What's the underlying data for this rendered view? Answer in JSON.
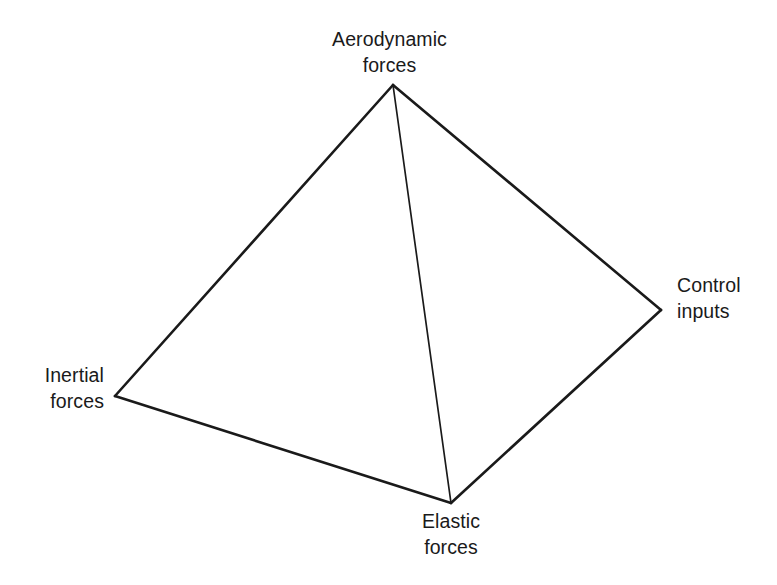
{
  "figure": {
    "type": "tetrahedron-diagram",
    "background_color": "#ffffff",
    "stroke_color": "#1a1a1a",
    "edge_stroke_width": 2.6,
    "interior_edge_stroke_width": 1.7,
    "vertices": [
      {
        "id": "apex",
        "label_line1": "Aerodynamic",
        "label_line2": "forces",
        "x": 393,
        "y": 85
      },
      {
        "id": "right",
        "label_line1": "Control",
        "label_line2": "inputs",
        "x": 661,
        "y": 310
      },
      {
        "id": "left",
        "label_line1": "Inertial",
        "label_line2": "forces",
        "x": 115,
        "y": 396
      },
      {
        "id": "bottom",
        "label_line1": "Elastic",
        "label_line2": "forces",
        "x": 451,
        "y": 503
      }
    ],
    "edges": [
      {
        "id": "apex-left",
        "from": "apex",
        "to": "left",
        "kind": "outline"
      },
      {
        "id": "apex-right",
        "from": "apex",
        "to": "right",
        "kind": "outline"
      },
      {
        "id": "left-bottom",
        "from": "left",
        "to": "bottom",
        "kind": "outline"
      },
      {
        "id": "right-bottom",
        "from": "right",
        "to": "bottom",
        "kind": "outline"
      },
      {
        "id": "apex-bottom",
        "from": "apex",
        "to": "bottom",
        "kind": "interior"
      }
    ]
  },
  "labels": {
    "aerodynamic": {
      "line1": "Aerodynamic",
      "line2": "forces"
    },
    "control": {
      "line1": "Control",
      "line2": "inputs"
    },
    "inertial": {
      "line1": "Inertial",
      "line2": "forces"
    },
    "elastic": {
      "line1": "Elastic",
      "line2": "forces"
    }
  }
}
